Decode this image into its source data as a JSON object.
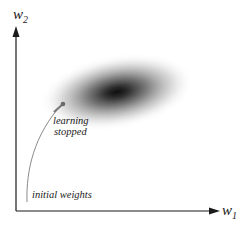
{
  "diagram": {
    "type": "error-surface-contour",
    "axes": {
      "x": {
        "label": "w",
        "subscript": "1"
      },
      "y": {
        "label": "w",
        "subscript": "2"
      }
    },
    "annotations": {
      "start": "initial weights",
      "end_line1": "learning",
      "end_line2": "stopped"
    },
    "colors": {
      "axis": "#1a1a1a",
      "path": "#8a8a8a",
      "minimum_core": "#0a0a0a",
      "background": "#ffffff"
    }
  }
}
